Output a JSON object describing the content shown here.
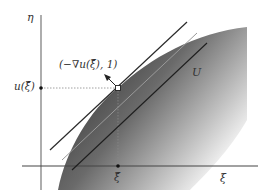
{
  "figure": {
    "axes": {
      "y_axis_label": "η",
      "x_axis_label": "ξ"
    },
    "labels": {
      "u_of_xi_bar": "u(ξ̄)",
      "xi_bar": "ξ̄",
      "normal_vector": "(−∇u(ξ̄), 1)",
      "region": "U"
    },
    "colors": {
      "region_dark": "#3a3a3a",
      "region_light": "#ffffff",
      "axis": "#555555",
      "tangent_line": "#2a2a2a",
      "light_line": "#9a9a9a",
      "inner_line": "#1e1e1e",
      "dotted_guide": "#777777"
    }
  }
}
